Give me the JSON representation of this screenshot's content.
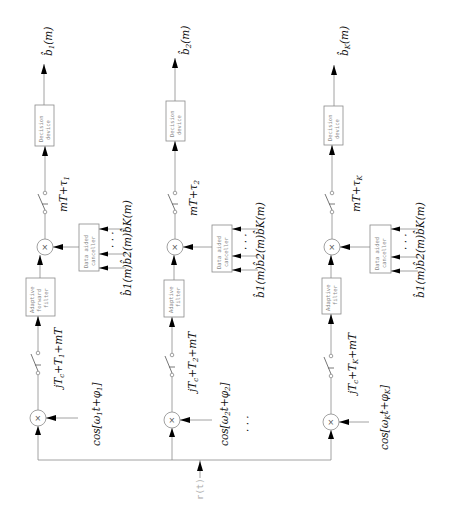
{
  "diagram": {
    "title": "",
    "orientation": "rotated 90 degrees counter-clockwise; signal flows bottom to top",
    "input": {
      "label": "r(t)"
    },
    "branches": [
      {
        "id": "1",
        "x": 40,
        "output_label": "b̂1(m)",
        "output_main": "b̂",
        "output_sub": "1",
        "output_tail": "(m)",
        "decision_device": [
          "Decision",
          "device"
        ],
        "output_sampler_label_main": "mT+τ",
        "output_sampler_label_sub": "1",
        "canceller": [
          "Data aided",
          "canceller"
        ],
        "canceller_input_label": "b̂1(m)b̂2(m)b̂K(m)",
        "canceller_dots": "· · ·",
        "filter": [
          "Adaptive",
          "forward",
          "filter"
        ],
        "chip_sampler_label_main": "jT",
        "chip_sampler_label_c": "c",
        "chip_sampler_label_mid": "+T",
        "chip_sampler_label_sub": "1",
        "chip_sampler_label_tail": "+mT",
        "carrier_label_main": "cos[ω",
        "carrier_label_sub": "1",
        "carrier_label_mid": "t+φ",
        "carrier_label_sub2": "1",
        "carrier_label_tail": "]"
      },
      {
        "id": "2",
        "x": 172,
        "output_label": "b̂2(m)",
        "output_main": "b̂",
        "output_sub": "2",
        "output_tail": "(m)",
        "decision_device": [
          "Decision",
          "device"
        ],
        "output_sampler_label_main": "mT+τ",
        "output_sampler_label_sub": "2",
        "canceller": [
          "Data aided",
          "canceller"
        ],
        "canceller_input_label": "b̂1(m)b̂2(m)b̂K(m)",
        "canceller_dots": "· · ·",
        "filter": [
          "Adaptive",
          "filter"
        ],
        "chip_sampler_label_main": "jT",
        "chip_sampler_label_c": "c",
        "chip_sampler_label_mid": "+T",
        "chip_sampler_label_sub": "2",
        "chip_sampler_label_tail": "+mT",
        "carrier_label_main": "cos[ω",
        "carrier_label_sub": "2",
        "carrier_label_mid": "t+φ",
        "carrier_label_sub2": "2",
        "carrier_label_tail": "]"
      },
      {
        "id": "K",
        "x": 331,
        "output_label": "b̂K(m)",
        "output_main": "b̂",
        "output_sub": "K",
        "output_tail": "(m)",
        "decision_device": [
          "Decision",
          "device"
        ],
        "output_sampler_label_main": "mT+τ",
        "output_sampler_label_sub": "K",
        "canceller": [
          "Data aided",
          "canceller"
        ],
        "canceller_input_label": "b̂1(m)b̂2(m)b̂K(m)",
        "canceller_dots": "· · ·",
        "filter": [
          "Adaptive",
          "filter"
        ],
        "chip_sampler_label_main": "jT",
        "chip_sampler_label_c": "c",
        "chip_sampler_label_mid": "+T",
        "chip_sampler_label_sub": "K",
        "chip_sampler_label_tail": "+mT",
        "carrier_label_main": "cos[ω",
        "carrier_label_sub": "K",
        "carrier_label_mid": "t+φ",
        "carrier_label_sub2": "K",
        "carrier_label_tail": "]"
      }
    ],
    "between_branches_dots": "·   ·   ·",
    "multiplier_symbol": "×",
    "colors": {
      "wire": "#8a8a8a",
      "arrow": "#000000",
      "math_text": "#111111",
      "box_text": "#8a8a8a"
    }
  }
}
